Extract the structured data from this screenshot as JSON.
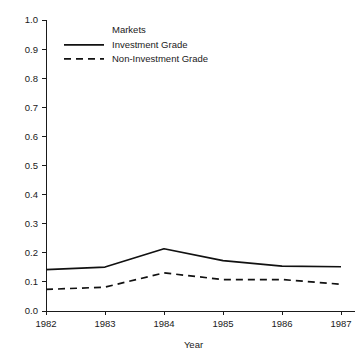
{
  "chart_data": {
    "type": "line",
    "title": "",
    "xlabel": "Year",
    "ylabel": "",
    "x": [
      1982,
      1983,
      1984,
      1985,
      1986,
      1987
    ],
    "xtick_labels": [
      "1982",
      "1983",
      "1984",
      "1985",
      "1986",
      "1987"
    ],
    "ytick_labels": [
      "0.0",
      "0.1",
      "0.2",
      "0.3",
      "0.4",
      "0.5",
      "0.6",
      "0.7",
      "0.8",
      "0.9",
      "1.0"
    ],
    "ytick_values": [
      0.0,
      0.1,
      0.2,
      0.3,
      0.4,
      0.5,
      0.6,
      0.7,
      0.8,
      0.9,
      1.0
    ],
    "xlim": [
      1982,
      1987
    ],
    "ylim": [
      0.0,
      1.0
    ],
    "grid": false,
    "legend_position": "top-center",
    "legend_title": "Markets",
    "series": [
      {
        "name": "Investment Grade",
        "style": "solid",
        "color": "#111111",
        "values": [
          0.142,
          0.151,
          0.214,
          0.173,
          0.154,
          0.152
        ]
      },
      {
        "name": "Non-Investment Grade",
        "style": "dashed",
        "color": "#111111",
        "values": [
          0.074,
          0.082,
          0.131,
          0.108,
          0.108,
          0.092
        ]
      }
    ]
  },
  "axes": {
    "x_axis_title": "Year",
    "y_axis_title": ""
  },
  "legend": {
    "title": "Markets",
    "entries": [
      {
        "label": "Investment Grade",
        "style": "solid"
      },
      {
        "label": "Non-Investment Grade",
        "style": "dashed"
      }
    ]
  },
  "colors": {
    "axis": "#1a1a1a",
    "series": "#111111",
    "background": "#ffffff"
  }
}
